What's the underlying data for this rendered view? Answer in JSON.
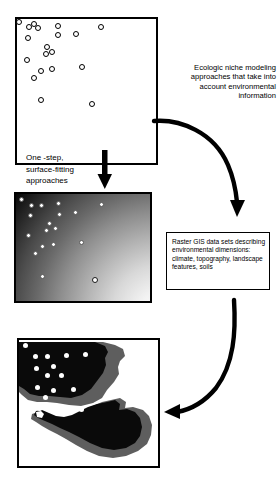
{
  "figure": {
    "background_color": "#ffffff",
    "ink_color": "#000000"
  },
  "panels": {
    "occurrence": {
      "name": "Occurrence point scatter panel",
      "border_color": "#000000",
      "fill_color": "#ffffff",
      "marker_style": "open-circle",
      "point_count": 19,
      "points": [
        {
          "x": 2,
          "y": 3
        },
        {
          "x": 9,
          "y": 8
        },
        {
          "x": 17,
          "y": 9
        },
        {
          "x": 31,
          "y": 7
        },
        {
          "x": 32,
          "y": 16
        },
        {
          "x": 10,
          "y": 18
        },
        {
          "x": 44,
          "y": 14
        },
        {
          "x": 64,
          "y": 8
        },
        {
          "x": 24,
          "y": 26
        },
        {
          "x": 29,
          "y": 30
        },
        {
          "x": 22,
          "y": 32
        },
        {
          "x": 8,
          "y": 37
        },
        {
          "x": 18,
          "y": 46
        },
        {
          "x": 27,
          "y": 44
        },
        {
          "x": 49,
          "y": 43
        },
        {
          "x": 14,
          "y": 52
        },
        {
          "x": 18,
          "y": 70
        },
        {
          "x": 57,
          "y": 73
        },
        {
          "x": 12,
          "y": 4
        }
      ]
    },
    "gradient": {
      "name": "Environmental surface panel",
      "border_color": "#000000",
      "gradient_dark": "#060606",
      "gradient_light": "#ffffff",
      "gradient_direction": "dark upper-left to light lower-right",
      "marker_style": "filled-white-circle",
      "point_count": 18,
      "points": [
        {
          "x": 3,
          "y": 4
        },
        {
          "x": 11,
          "y": 9
        },
        {
          "x": 19,
          "y": 9
        },
        {
          "x": 32,
          "y": 7
        },
        {
          "x": 33,
          "y": 17
        },
        {
          "x": 11,
          "y": 18
        },
        {
          "x": 45,
          "y": 14
        },
        {
          "x": 65,
          "y": 8
        },
        {
          "x": 25,
          "y": 26
        },
        {
          "x": 30,
          "y": 30
        },
        {
          "x": 22,
          "y": 32
        },
        {
          "x": 9,
          "y": 37
        },
        {
          "x": 19,
          "y": 46
        },
        {
          "x": 28,
          "y": 44
        },
        {
          "x": 50,
          "y": 43
        },
        {
          "x": 15,
          "y": 52
        },
        {
          "x": 19,
          "y": 70
        },
        {
          "x": 58,
          "y": 73
        }
      ]
    },
    "distribution": {
      "name": "Predicted distribution map panel",
      "border_color": "#000000",
      "core_color": "#0a0a0a",
      "halo_color": "#5e5e5e",
      "background_color": "#ffffff",
      "marker_style": "filled-white-circle",
      "point_count": 15,
      "points": [
        {
          "x": 4,
          "y": 4
        },
        {
          "x": 12,
          "y": 13
        },
        {
          "x": 21,
          "y": 13
        },
        {
          "x": 35,
          "y": 12
        },
        {
          "x": 12,
          "y": 24
        },
        {
          "x": 25,
          "y": 22
        },
        {
          "x": 50,
          "y": 11
        },
        {
          "x": 20,
          "y": 31
        },
        {
          "x": 31,
          "y": 31
        },
        {
          "x": 13,
          "y": 42
        },
        {
          "x": 25,
          "y": 45
        },
        {
          "x": 40,
          "y": 44
        },
        {
          "x": 19,
          "y": 52
        },
        {
          "x": 14,
          "y": 62
        },
        {
          "x": 46,
          "y": 63
        }
      ]
    }
  },
  "annotations": {
    "niche_text": "Ecologic niche modeling approaches that take into account environmental information",
    "onestep_text": "One -step, surface-fitting approaches",
    "raster_text": "Raster GIS data sets describing environmental dimensions: climate, topography, landscape features, soils"
  },
  "arrows": {
    "down_arrow": {
      "name": "down-arrow",
      "direction": "down"
    },
    "curve_arrow_1": {
      "name": "curved-arrow-to-raster",
      "direction": "right-then-down"
    },
    "curve_arrow_2": {
      "name": "curved-arrow-to-distribution",
      "direction": "down-then-left"
    }
  }
}
